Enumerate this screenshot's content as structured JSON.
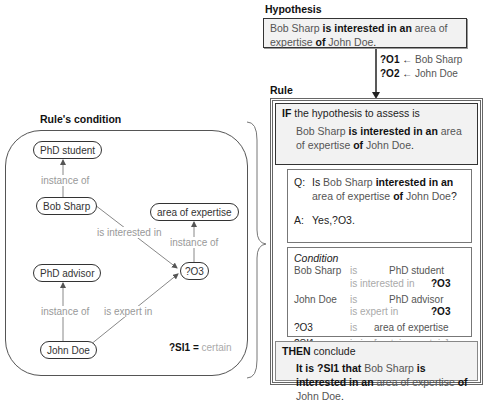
{
  "hypothesis": {
    "title": "Hypothesis",
    "text": {
      "s1": "Bob Sharp",
      "s2": " is interested in an ",
      "s3": "area of expertise",
      "s4": " of ",
      "s5": "John Doe",
      "s6": "."
    },
    "bindings": [
      {
        "var": "?O1",
        "arrow": "←",
        "value": "Bob Sharp"
      },
      {
        "var": "?O2",
        "arrow": "←",
        "value": "John Doe"
      }
    ]
  },
  "rule": {
    "title": "Rule",
    "if": {
      "kw": "IF",
      "label": " the hypothesis to assess is",
      "text": {
        "s1": "Bob Sharp",
        "s2": " is interested in an ",
        "s3": "area of expertise",
        "s4": " of ",
        "s5": "John Doe",
        "s6": "."
      }
    },
    "qa": {
      "q_label": "Q:",
      "q": {
        "s0": "Is ",
        "s1": "Bob Sharp",
        "s2": " interested in an ",
        "s3": "area of expertise",
        "s4": " of ",
        "s5": "John Doe",
        "s6": "?"
      },
      "a_label": "A:",
      "a": "Yes,?O3."
    },
    "condition": {
      "title": "Condition",
      "rows": [
        {
          "subj": "Bob Sharp",
          "rel": "is",
          "obj": "PhD student"
        },
        {
          "subj": "",
          "rel": "is interested in",
          "obj": "?O3"
        },
        {
          "subj": "John Doe",
          "rel": "is",
          "obj": "PhD advisor"
        },
        {
          "subj": "",
          "rel": "is expert in",
          "obj": "?O3"
        },
        {
          "subj": "?O3",
          "rel": "is",
          "obj": "area of expertise"
        },
        {
          "subj": "?SI1",
          "rel": "is-in",
          "obj": "[certain - certain]"
        }
      ]
    },
    "then": {
      "kw": "THEN",
      "label": " conclude",
      "text": {
        "s0": "It is ?SI1 that ",
        "s1": "Bob Sharp",
        "s2": " is interested in an ",
        "s3": "area of expertise",
        "s4": " of ",
        "s5": "John Doe",
        "s6": "."
      }
    }
  },
  "rule_condition": {
    "title": "Rule's condition",
    "nodes": {
      "phd_student": "PhD student",
      "bob_sharp": "Bob Sharp",
      "area": "area of expertise",
      "o3": "?O3",
      "phd_advisor": "PhD advisor",
      "john_doe": "John Doe"
    },
    "edges": {
      "inst1": "instance of",
      "interested": "is interested in",
      "inst2": "instance of",
      "inst3": "instance of",
      "expert": "is expert in"
    },
    "si": {
      "var": "?SI1",
      "eq": " = ",
      "val": "certain"
    }
  }
}
